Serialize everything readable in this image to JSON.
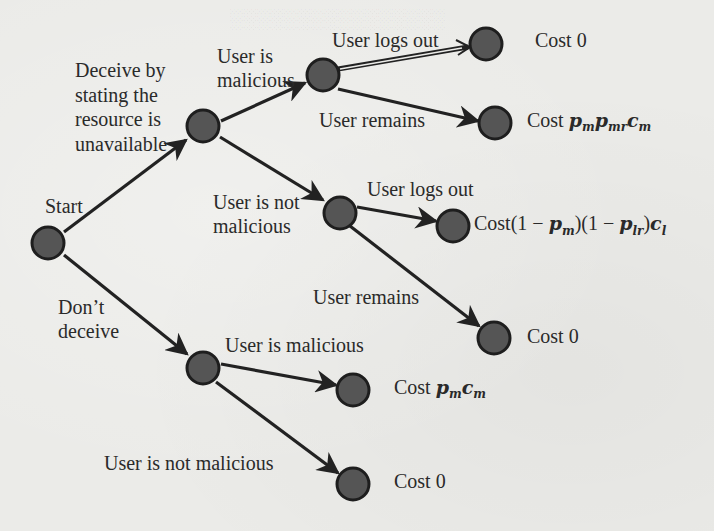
{
  "diagram": {
    "type": "decision-tree",
    "colors": {
      "node_fill": "#555555",
      "node_stroke": "#1e1e1e",
      "edge": "#222222",
      "background": "#ebebe8",
      "text": "#2a2a2a"
    },
    "root": {
      "label": "Start"
    },
    "branches": {
      "deceive": {
        "label": "Deceive by stating the resource is unavailable",
        "label_lines": [
          "Deceive by",
          "stating the",
          "resource is",
          "unavailable"
        ],
        "malicious": {
          "label_lines": [
            "User is",
            "malicious"
          ],
          "logs_out": {
            "edge_label": "User logs out",
            "cost": "Cost 0"
          },
          "remains": {
            "edge_label": "User remains",
            "cost_prefix": "Cost",
            "cost_math": "p_m p_mr c_m"
          }
        },
        "not_malicious": {
          "label_lines": [
            "User is not",
            "malicious"
          ],
          "logs_out": {
            "edge_label": "User logs out",
            "cost_prefix": "Cost",
            "cost_math": "(1 − p_m)(1 − p_lr) c_l"
          },
          "remains": {
            "edge_label": "User remains",
            "cost": "Cost 0"
          }
        }
      },
      "dont_deceive": {
        "label_lines": [
          "Don’t",
          "deceive"
        ],
        "malicious": {
          "edge_label": "User is malicious",
          "cost_prefix": "Cost",
          "cost_math": "p_m c_m"
        },
        "not_malicious": {
          "edge_label": "User is not malicious",
          "cost": "Cost 0"
        }
      }
    },
    "math_parts": {
      "pm": "p",
      "pm_sub": "m",
      "pmr": "p",
      "pmr_sub": "mr",
      "cm": "c",
      "cm_sub": "m",
      "plr": "p",
      "plr_sub": "lr",
      "cl": "c",
      "cl_sub": "l",
      "one_minus": "(1 − ",
      "close": ")"
    }
  }
}
